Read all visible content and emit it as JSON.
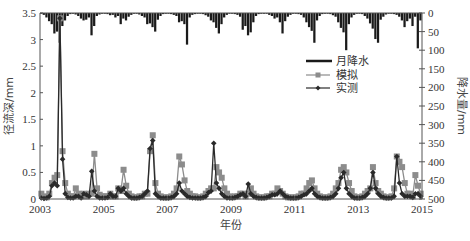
{
  "chart_data": {
    "type": "line",
    "title": "",
    "xlabel": "年份",
    "ylabel_left": "径流深/mm",
    "ylabel_right": "降水量/mm",
    "xlim": [
      2003,
      2015
    ],
    "ylim_left": [
      0,
      3.5
    ],
    "ylim_right_inverted": [
      0,
      500
    ],
    "x_ticks": [
      "2003",
      "2005",
      "2007",
      "2009",
      "2011",
      "2013",
      "2015"
    ],
    "y_left_ticks": [
      "0",
      "0.5",
      "1",
      "1.5",
      "2",
      "2.5",
      "3",
      "3.5"
    ],
    "y_right_ticks": [
      "0",
      "50",
      "100",
      "150",
      "200",
      "250",
      "300",
      "350",
      "400",
      "450",
      "500"
    ],
    "legend": [
      "月降水",
      "模拟",
      "实测"
    ],
    "legend_position": "upper right",
    "grid": false,
    "months_start": "2003-01",
    "series": [
      {
        "name": "月降水",
        "type": "bar",
        "axis": "right",
        "values": [
          2,
          5,
          12,
          22,
          30,
          55,
          50,
          80,
          35,
          20,
          8,
          3,
          2,
          4,
          8,
          15,
          20,
          18,
          12,
          60,
          35,
          8,
          4,
          2,
          2,
          3,
          6,
          5,
          12,
          8,
          30,
          15,
          20,
          10,
          5,
          2,
          2,
          4,
          8,
          12,
          30,
          28,
          38,
          50,
          18,
          8,
          3,
          2,
          2,
          3,
          5,
          8,
          25,
          22,
          30,
          85,
          12,
          5,
          3,
          2,
          2,
          3,
          6,
          10,
          20,
          25,
          40,
          55,
          30,
          12,
          5,
          2,
          2,
          3,
          5,
          10,
          45,
          35,
          60,
          52,
          25,
          8,
          3,
          2,
          2,
          2,
          5,
          8,
          15,
          12,
          25,
          55,
          22,
          10,
          5,
          2,
          2,
          3,
          5,
          12,
          25,
          38,
          48,
          80,
          20,
          8,
          3,
          2,
          2,
          3,
          6,
          10,
          25,
          40,
          52,
          100,
          30,
          12,
          5,
          2,
          2,
          3,
          8,
          15,
          28,
          42,
          70,
          80,
          18,
          10,
          4,
          2,
          2,
          3,
          5,
          10,
          20,
          38,
          22,
          15,
          35,
          10,
          95,
          20
        ]
      },
      {
        "name": "模拟",
        "type": "line",
        "marker": "square",
        "axis": "left",
        "values": [
          0.1,
          0.05,
          0.03,
          0.1,
          0.3,
          0.4,
          0.45,
          3.4,
          0.9,
          0.3,
          0.1,
          0.05,
          0.05,
          0.2,
          0.1,
          0.05,
          0.1,
          0.05,
          0.1,
          0.1,
          0.85,
          0.2,
          0.08,
          0.05,
          0.05,
          0.05,
          0.1,
          0.05,
          0.05,
          0.2,
          0.15,
          0.55,
          0.25,
          0.1,
          0.05,
          0.03,
          0.03,
          0.05,
          0.05,
          0.1,
          0.1,
          0.9,
          1.2,
          0.3,
          0.1,
          0.05,
          0.03,
          0.03,
          0.03,
          0.05,
          0.1,
          0.2,
          0.8,
          0.65,
          0.35,
          0.15,
          0.1,
          0.05,
          0.05,
          0.03,
          0.03,
          0.05,
          0.1,
          0.15,
          0.2,
          0.2,
          0.6,
          0.5,
          0.4,
          0.2,
          0.1,
          0.05,
          0.03,
          0.05,
          0.05,
          0.1,
          0.1,
          0.05,
          0.1,
          0.2,
          0.1,
          0.05,
          0.03,
          0.03,
          0.03,
          0.05,
          0.05,
          0.1,
          0.1,
          0.2,
          0.15,
          0.1,
          0.05,
          0.03,
          0.03,
          0.03,
          0.03,
          0.05,
          0.1,
          0.1,
          0.2,
          0.3,
          0.35,
          0.2,
          0.1,
          0.05,
          0.03,
          0.03,
          0.03,
          0.05,
          0.1,
          0.2,
          0.3,
          0.55,
          0.6,
          0.5,
          0.3,
          0.15,
          0.05,
          0.03,
          0.03,
          0.05,
          0.1,
          0.15,
          0.2,
          0.6,
          0.3,
          0.15,
          0.1,
          0.05,
          0.03,
          0.03,
          0.05,
          0.2,
          0.8,
          0.7,
          0.6,
          0.3,
          0.1,
          0.1,
          0.05,
          0.45,
          0.25,
          0.1
        ]
      },
      {
        "name": "实测",
        "type": "line",
        "marker": "diamond",
        "axis": "left",
        "values": [
          0.02,
          0.01,
          0.02,
          0.05,
          0.25,
          0.3,
          0.25,
          3.4,
          0.75,
          0.1,
          0.03,
          0.02,
          0.02,
          0.05,
          0.05,
          0.02,
          0.1,
          0.08,
          0.05,
          0.52,
          0.15,
          0.05,
          0.02,
          0.02,
          0.02,
          0.03,
          0.1,
          0.05,
          0.05,
          0.2,
          0.15,
          0.2,
          0.1,
          0.05,
          0.02,
          0.02,
          0.02,
          0.03,
          0.05,
          0.1,
          0.15,
          0.95,
          1.1,
          0.1,
          0.05,
          0.02,
          0.02,
          0.02,
          0.02,
          0.03,
          0.05,
          0.1,
          0.3,
          0.15,
          0.1,
          0.05,
          0.03,
          0.02,
          0.02,
          0.02,
          0.02,
          0.03,
          0.05,
          0.12,
          0.15,
          1.05,
          0.3,
          0.2,
          0.1,
          0.05,
          0.02,
          0.02,
          0.02,
          0.03,
          0.05,
          0.08,
          0.1,
          0.05,
          0.28,
          0.1,
          0.05,
          0.03,
          0.02,
          0.02,
          0.02,
          0.03,
          0.05,
          0.08,
          0.08,
          0.1,
          0.15,
          0.1,
          0.05,
          0.03,
          0.02,
          0.02,
          0.02,
          0.03,
          0.05,
          0.08,
          0.1,
          0.15,
          0.2,
          0.1,
          0.05,
          0.03,
          0.02,
          0.02,
          0.02,
          0.03,
          0.05,
          0.1,
          0.2,
          0.4,
          0.5,
          0.2,
          0.1,
          0.05,
          0.02,
          0.02,
          0.02,
          0.03,
          0.05,
          0.1,
          0.2,
          0.5,
          0.2,
          0.1,
          0.05,
          0.03,
          0.02,
          0.02,
          0.02,
          0.05,
          0.8,
          0.3,
          0.1,
          0.05,
          0.05,
          0.05,
          0.03,
          0.1,
          0.1,
          0.05
        ]
      }
    ]
  },
  "colors": {
    "precip": "#1a1a1a",
    "simulated": "#8c8c8c",
    "observed": "#2a2a2a",
    "axis": "#555555"
  }
}
